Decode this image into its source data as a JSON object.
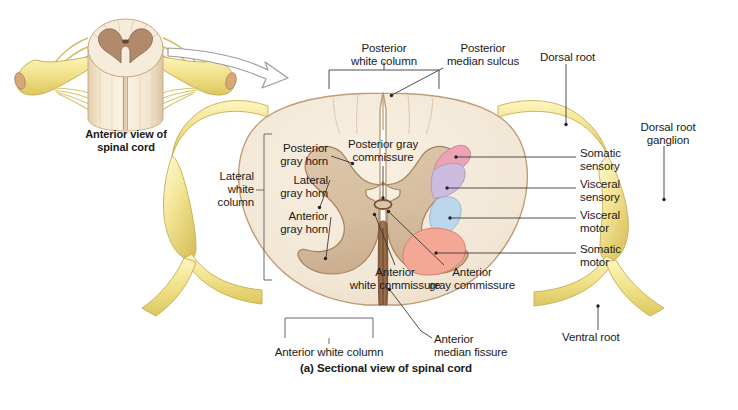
{
  "figure": {
    "caption": "(a) Sectional view of spinal cord",
    "inset_title": "Anterior view of\nspinal cord"
  },
  "labels": {
    "posterior_white_column": "Posterior\nwhite column",
    "posterior_median_sulcus": "Posterior\nmedian sulcus",
    "dorsal_root": "Dorsal root",
    "dorsal_root_ganglion": "Dorsal root\nganglion",
    "posterior_gray_horn": "Posterior\ngray horn",
    "lateral_gray_horn": "Lateral\ngray horn",
    "anterior_gray_horn": "Anterior\ngray horn",
    "lateral_white_column": "Lateral\nwhite\ncolumn",
    "posterior_gray_commissure": "Posterior gray\ncommissure",
    "anterior_white_commissure": "Anterior\nwhite commissure",
    "anterior_gray_commissure": "Anterior\ngray commissure",
    "anterior_white_column": "Anterior white column",
    "anterior_median_fissure": "Anterior\nmedian fissure",
    "ventral_root": "Ventral root",
    "somatic_sensory": "Somatic\nsensory",
    "visceral_sensory": "Visceral\nsensory",
    "visceral_motor": "Visceral\nmotor",
    "somatic_motor": "Somatic\nmotor"
  },
  "colors": {
    "white_matter": "#f3e9d9",
    "white_matter_edge": "#c9a882",
    "gray_matter": "#d9c1a3",
    "gray_matter_edge": "#a8825c",
    "nerve_yellow": "#f0e08a",
    "nerve_yellow_edge": "#c9b14e",
    "inset_gray_matter": "#b08a6a",
    "fissure_brown": "#8a6042",
    "somatic_sensory": "#eda3b6",
    "visceral_sensory": "#cdbcdf",
    "visceral_motor": "#bcd6ec",
    "somatic_motor": "#f3a794",
    "leader_line": "#3a3a3a",
    "bracket": "#4a4a4a",
    "arrow_outline": "#9a9aa0",
    "text": "#1a1a1a"
  }
}
